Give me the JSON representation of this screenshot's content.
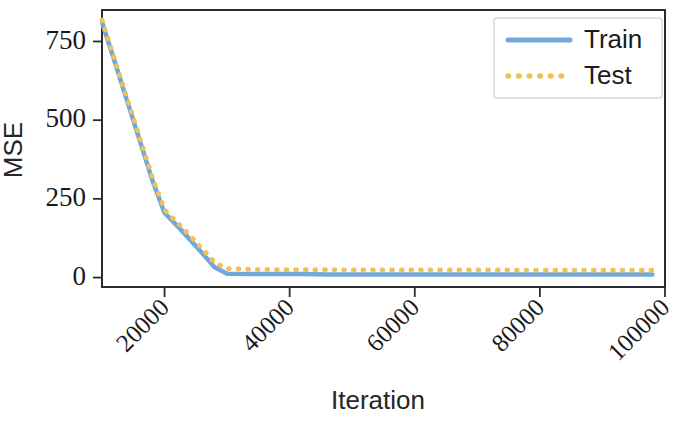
{
  "chart_data": {
    "type": "line",
    "title": "",
    "xlabel": "Iteration",
    "ylabel": "MSE",
    "xlim": [
      10000,
      100000
    ],
    "ylim": [
      -30,
      850
    ],
    "grid": false,
    "legend_position": "top-right",
    "x_ticks": [
      20000,
      40000,
      60000,
      80000,
      100000
    ],
    "x_tick_labels": [
      "20000",
      "40000",
      "60000",
      "80000",
      "100000"
    ],
    "y_ticks": [
      0,
      250,
      500,
      750
    ],
    "y_tick_labels": [
      "0",
      "250",
      "500",
      "750"
    ],
    "x": [
      10000,
      12000,
      14000,
      16000,
      18000,
      20000,
      22000,
      24000,
      26000,
      28000,
      30000,
      34000,
      38000,
      42000,
      46000,
      50000,
      54000,
      58000,
      62000,
      66000,
      70000,
      74000,
      78000,
      82000,
      86000,
      90000,
      94000,
      98000
    ],
    "series": [
      {
        "name": "Train",
        "color": "#6fa8dc",
        "style": "solid",
        "values": [
          812,
          688,
          562,
          438,
          312,
          205,
          165,
          122,
          78,
          33,
          12,
          11,
          11,
          11,
          10,
          10,
          10,
          10,
          10,
          10,
          10,
          10,
          10,
          10,
          10,
          10,
          10,
          10
        ]
      },
      {
        "name": "Test",
        "color": "#f0c05a",
        "style": "dotted",
        "values": [
          818,
          694,
          570,
          446,
          322,
          215,
          176,
          134,
          92,
          48,
          28,
          26,
          25,
          25,
          25,
          24,
          24,
          24,
          24,
          24,
          24,
          24,
          23,
          23,
          23,
          23,
          23,
          23
        ]
      }
    ]
  },
  "legend": {
    "entries": [
      {
        "label": "Train"
      },
      {
        "label": "Test"
      }
    ]
  },
  "axes": {
    "x_title": "Iteration",
    "y_title": "MSE"
  }
}
